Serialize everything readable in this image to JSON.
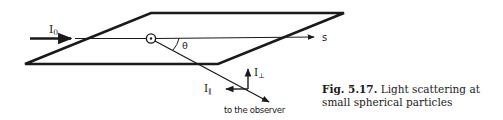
{
  "diagram": {
    "labels": {
      "incident": "I",
      "incident_sub": "0",
      "angle": "θ",
      "direction": "s",
      "perp": "I",
      "perp_sub": "⊥",
      "parallel": "I",
      "parallel_sub": "∥",
      "observer": "to the observer"
    }
  },
  "caption": {
    "number": "Fig. 5.17.",
    "text": "Light scattering at small spherical particles"
  },
  "colors": {
    "ink": "#1a1a1a",
    "background": "#ffffff"
  }
}
